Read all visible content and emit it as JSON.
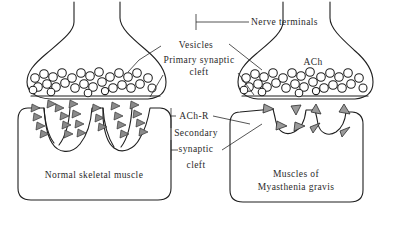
{
  "figure": {
    "background_color": "#ffffff",
    "line_color": "#1f1f1f",
    "receptor_color": "#8a8a8a",
    "width": 394,
    "height": 226
  },
  "labels": {
    "nerve_terminals": "Nerve terminals",
    "vesicles": "Vesicles",
    "primary_synaptic_cleft_line1": "Primary synaptic",
    "primary_synaptic_cleft_line2": "cleft",
    "ach": "ACh",
    "ach_r": "ACh-R",
    "secondary_synaptic_cleft_line1": "Secondary",
    "secondary_synaptic_cleft_line2": "synaptic",
    "secondary_synaptic_cleft_line3": "cleft",
    "normal_muscle": "Normal skeletal muscle",
    "myasthenia_muscle_line1": "Muscles of",
    "myasthenia_muscle_line2": "Myasthenia gravis"
  },
  "panels": {
    "left": {
      "name": "normal-neuromuscular-junction",
      "receptor_count": 24,
      "fold_count": 3,
      "fold_depth": "deep",
      "vesicle_count": 30
    },
    "right": {
      "name": "myasthenic-neuromuscular-junction",
      "receptor_count": 8,
      "fold_count": 3,
      "fold_depth": "shallow",
      "vesicle_count": 30
    }
  }
}
